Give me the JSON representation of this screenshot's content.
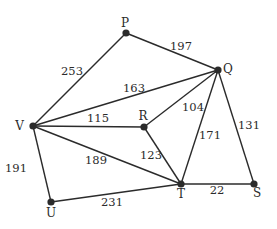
{
  "diagram": {
    "type": "weighted-graph",
    "nodes": [
      {
        "id": "P",
        "label": "P",
        "x": 126,
        "y": 33,
        "lx": 125,
        "ly": 27,
        "anchor": "middle"
      },
      {
        "id": "Q",
        "label": "Q",
        "x": 218,
        "y": 70,
        "lx": 223,
        "ly": 73,
        "anchor": "start"
      },
      {
        "id": "V",
        "label": "V",
        "x": 33,
        "y": 126,
        "lx": 24,
        "ly": 130,
        "anchor": "end"
      },
      {
        "id": "R",
        "label": "R",
        "x": 144,
        "y": 127,
        "lx": 143,
        "ly": 120,
        "anchor": "middle"
      },
      {
        "id": "U",
        "label": "U",
        "x": 51,
        "y": 202,
        "lx": 51,
        "ly": 217,
        "anchor": "middle"
      },
      {
        "id": "T",
        "label": "T",
        "x": 181,
        "y": 184,
        "lx": 181,
        "ly": 198,
        "anchor": "middle"
      },
      {
        "id": "S",
        "label": "S",
        "x": 254,
        "y": 184,
        "lx": 257,
        "ly": 197,
        "anchor": "middle"
      }
    ],
    "edges": [
      {
        "from": "P",
        "to": "V",
        "weight": "253",
        "wx": 72,
        "wy": 75
      },
      {
        "from": "P",
        "to": "Q",
        "weight": "197",
        "wx": 181,
        "wy": 50
      },
      {
        "from": "V",
        "to": "Q",
        "weight": "163",
        "wx": 134,
        "wy": 92
      },
      {
        "from": "V",
        "to": "R",
        "weight": "115",
        "wx": 98,
        "wy": 122
      },
      {
        "from": "R",
        "to": "Q",
        "weight": "104",
        "wx": 193,
        "wy": 111
      },
      {
        "from": "V",
        "to": "T",
        "weight": "189",
        "wx": 96,
        "wy": 164
      },
      {
        "from": "R",
        "to": "T",
        "weight": "123",
        "wx": 151,
        "wy": 159
      },
      {
        "from": "Q",
        "to": "T",
        "weight": "171",
        "wx": 210,
        "wy": 139
      },
      {
        "from": "Q",
        "to": "S",
        "weight": "131",
        "wx": 249,
        "wy": 129
      },
      {
        "from": "T",
        "to": "S",
        "weight": "22",
        "wx": 217,
        "wy": 194
      },
      {
        "from": "V",
        "to": "U",
        "weight": "191",
        "wx": 16,
        "wy": 172
      },
      {
        "from": "U",
        "to": "T",
        "weight": "231",
        "wx": 112,
        "wy": 206
      }
    ]
  }
}
